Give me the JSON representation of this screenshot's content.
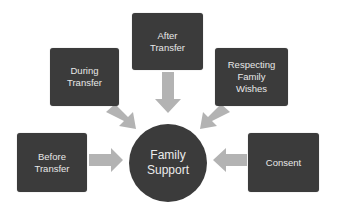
{
  "diagram": {
    "type": "hub-and-spoke",
    "hub": {
      "label": "Family\nSupport"
    },
    "nodes": [
      {
        "id": "before",
        "label": "Before\nTransfer"
      },
      {
        "id": "during",
        "label": "During\nTransfer"
      },
      {
        "id": "after",
        "label": "After\nTransfer"
      },
      {
        "id": "respecting",
        "label": "Respecting\nFamily\nWishes"
      },
      {
        "id": "consent",
        "label": "Consent"
      }
    ],
    "edges": [
      {
        "from": "before",
        "to": "hub"
      },
      {
        "from": "during",
        "to": "hub"
      },
      {
        "from": "after",
        "to": "hub"
      },
      {
        "from": "respecting",
        "to": "hub"
      },
      {
        "from": "consent",
        "to": "hub"
      }
    ],
    "colors": {
      "node_fill": "#3b3b3b",
      "node_text": "#e8e8e8",
      "arrow_fill": "#b3b3b3",
      "background": "#ffffff"
    }
  }
}
